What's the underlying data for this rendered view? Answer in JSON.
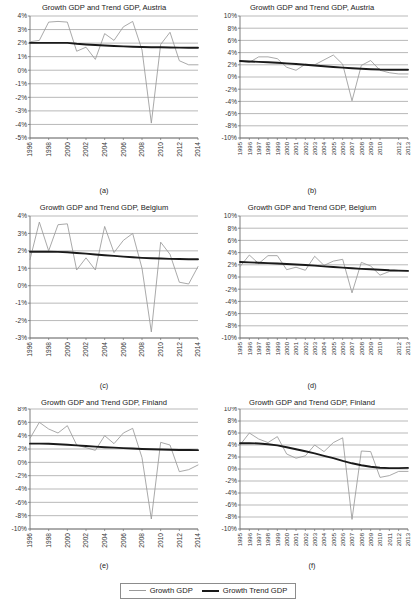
{
  "figure": {
    "legend": {
      "series_thin_label": "Growth GDP",
      "series_thick_label": "Growth Trend GDP",
      "thin_color": "#9a9a9a",
      "thick_color": "#1a1a1a"
    },
    "panel_letters": [
      "(a)",
      "(b)",
      "(c)",
      "(d)",
      "(e)",
      "(f)"
    ]
  },
  "chart_data": [
    {
      "id": "a",
      "type": "line",
      "title": "Growth GDP and Trend GDP, Austria",
      "caption": "(a)",
      "xlabel": "",
      "ylabel": "",
      "grid": true,
      "legend_position": "figure-bottom",
      "ylim": [
        -5,
        4
      ],
      "yticks": [
        4,
        3,
        2,
        1,
        0,
        -1,
        -2,
        -3,
        -4,
        -5
      ],
      "ytick_labels": [
        "4%",
        "3%",
        "2%",
        "1%",
        "0%",
        "-1%",
        "-2%",
        "-3%",
        "-4%",
        "-5%"
      ],
      "x": [
        1996,
        1997,
        1998,
        1999,
        2000,
        2001,
        2002,
        2003,
        2004,
        2005,
        2006,
        2007,
        2008,
        2009,
        2010,
        2011,
        2012,
        2013,
        2014
      ],
      "xtick_labels": [
        "1996",
        "1998",
        "2000",
        "2002",
        "2004",
        "2006",
        "2008",
        "2010",
        "2012",
        "2014"
      ],
      "series": [
        {
          "name": "Growth GDP",
          "values": [
            2.1,
            2.2,
            3.55,
            3.6,
            3.55,
            1.4,
            1.7,
            0.8,
            2.7,
            2.2,
            3.2,
            3.6,
            1.5,
            -3.9,
            1.9,
            2.8,
            0.7,
            0.4,
            0.4
          ]
        },
        {
          "name": "Growth Trend GDP",
          "values": [
            2.02,
            2.02,
            2.02,
            2.02,
            2.02,
            1.95,
            1.9,
            1.86,
            1.82,
            1.79,
            1.76,
            1.73,
            1.71,
            1.7,
            1.69,
            1.68,
            1.67,
            1.66,
            1.66
          ]
        }
      ]
    },
    {
      "id": "b",
      "type": "line",
      "title": "Growth GDP and Trend GDP, Austria",
      "caption": "(b)",
      "xlabel": "",
      "ylabel": "",
      "grid": true,
      "legend_position": "figure-bottom",
      "ylim": [
        -10,
        10
      ],
      "yticks": [
        10,
        8,
        6,
        4,
        2,
        0,
        -2,
        -4,
        -6,
        -8,
        -10
      ],
      "ytick_labels": [
        "10%",
        "8%",
        "6%",
        "4%",
        "2%",
        "0%",
        "-2%",
        "-4%",
        "-6%",
        "-8%",
        "-10%"
      ],
      "x": [
        1995,
        1996,
        1997,
        1998,
        1999,
        2000,
        2001,
        2002,
        2003,
        2004,
        2005,
        2006,
        2007,
        2008,
        2009,
        2010,
        2011,
        2012,
        2013
      ],
      "xtick_labels": [
        "1995",
        "1996",
        "1997",
        "1998",
        "1999",
        "2000",
        "2001",
        "2002",
        "2003",
        "2004",
        "2005",
        "2006",
        "2007",
        "2008",
        "2009",
        "2010",
        "2012",
        "2013"
      ],
      "series": [
        {
          "name": "Growth GDP",
          "values": [
            2.6,
            2.4,
            3.3,
            3.3,
            3.0,
            1.6,
            1.1,
            2.1,
            2.0,
            2.8,
            3.6,
            2.1,
            -3.9,
            1.9,
            2.7,
            1.1,
            0.7,
            0.5,
            0.5
          ]
        },
        {
          "name": "Growth Trend GDP",
          "values": [
            2.62,
            2.55,
            2.48,
            2.41,
            2.33,
            2.23,
            2.12,
            2.0,
            1.88,
            1.76,
            1.65,
            1.54,
            1.44,
            1.35,
            1.28,
            1.22,
            1.2,
            1.2,
            1.2
          ]
        }
      ]
    },
    {
      "id": "c",
      "type": "line",
      "title": "Growth GDP and Trend GDP, Belgium",
      "caption": "(c)",
      "xlabel": "",
      "ylabel": "",
      "grid": true,
      "legend_position": "figure-bottom",
      "ylim": [
        -3,
        4
      ],
      "yticks": [
        4,
        3,
        2,
        1,
        0,
        -1,
        -2,
        -3
      ],
      "ytick_labels": [
        "4%",
        "3%",
        "2%",
        "1%",
        "0%",
        "-1%",
        "-2%",
        "-3%"
      ],
      "x": [
        1996,
        1997,
        1998,
        1999,
        2000,
        2001,
        2002,
        2003,
        2004,
        2005,
        2006,
        2007,
        2008,
        2009,
        2010,
        2011,
        2012,
        2013,
        2014
      ],
      "xtick_labels": [
        "1996",
        "1998",
        "2000",
        "2002",
        "2004",
        "2006",
        "2008",
        "2010",
        "2012",
        "2014"
      ],
      "series": [
        {
          "name": "Growth GDP",
          "values": [
            1.5,
            3.65,
            2.0,
            3.5,
            3.55,
            0.9,
            1.6,
            0.9,
            3.4,
            1.9,
            2.6,
            3.0,
            1.0,
            -2.65,
            2.5,
            1.8,
            0.2,
            0.1,
            1.1
          ]
        },
        {
          "name": "Growth Trend GDP",
          "values": [
            1.95,
            1.95,
            1.95,
            1.94,
            1.92,
            1.88,
            1.84,
            1.79,
            1.75,
            1.71,
            1.67,
            1.63,
            1.6,
            1.58,
            1.56,
            1.54,
            1.53,
            1.52,
            1.52
          ]
        }
      ]
    },
    {
      "id": "d",
      "type": "line",
      "title": "Growth GDP and Trend GDP, Belgium",
      "caption": "(d)",
      "xlabel": "",
      "ylabel": "",
      "grid": true,
      "legend_position": "figure-bottom",
      "ylim": [
        -10,
        10
      ],
      "yticks": [
        10,
        8,
        6,
        4,
        2,
        0,
        -2,
        -4,
        -6,
        -8,
        -10
      ],
      "ytick_labels": [
        "10%",
        "8%",
        "6%",
        "4%",
        "2%",
        "0%",
        "-2%",
        "-4%",
        "-6%",
        "-8%",
        "-10%"
      ],
      "x": [
        1995,
        1996,
        1997,
        1998,
        1999,
        2000,
        2001,
        2002,
        2003,
        2004,
        2005,
        2006,
        2007,
        2008,
        2009,
        2010,
        2011,
        2012,
        2013
      ],
      "xtick_labels": [
        "1995",
        "1996",
        "1997",
        "1998",
        "1999",
        "2000",
        "2001",
        "2002",
        "2003",
        "2004",
        "2005",
        "2006",
        "2007",
        "2008",
        "2009",
        "2010",
        "2012",
        "2013"
      ],
      "series": [
        {
          "name": "Growth GDP",
          "values": [
            1.7,
            3.6,
            2.2,
            3.5,
            3.5,
            1.2,
            1.6,
            1.1,
            3.4,
            1.9,
            2.6,
            2.9,
            -2.6,
            2.4,
            1.8,
            0.3,
            0.9,
            1.0,
            1.0
          ]
        },
        {
          "name": "Growth Trend GDP",
          "values": [
            2.45,
            2.4,
            2.34,
            2.28,
            2.21,
            2.13,
            2.05,
            1.96,
            1.86,
            1.75,
            1.64,
            1.53,
            1.43,
            1.34,
            1.26,
            1.2,
            1.1,
            1.05,
            1.0
          ]
        }
      ]
    },
    {
      "id": "e",
      "type": "line",
      "title": "Growth GDP and Trend GDP, Finland",
      "caption": "(e)",
      "xlabel": "",
      "ylabel": "",
      "grid": true,
      "legend_position": "figure-bottom",
      "ylim": [
        -10,
        8
      ],
      "yticks": [
        8,
        6,
        4,
        2,
        0,
        -2,
        -4,
        -6,
        -8,
        -10
      ],
      "ytick_labels": [
        "8%",
        "6%",
        "4%",
        "2%",
        "0%",
        "-2%",
        "-4%",
        "-6%",
        "-8%",
        "-10%"
      ],
      "x": [
        1996,
        1997,
        1998,
        1999,
        2000,
        2001,
        2002,
        2003,
        2004,
        2005,
        2006,
        2007,
        2008,
        2009,
        2010,
        2011,
        2012,
        2013,
        2014
      ],
      "xtick_labels": [
        "1996",
        "1998",
        "2000",
        "2002",
        "2004",
        "2006",
        "2008",
        "2010",
        "2012",
        "2014"
      ],
      "series": [
        {
          "name": "Growth GDP",
          "values": [
            3.6,
            6.0,
            5.0,
            4.4,
            5.5,
            2.6,
            2.2,
            1.8,
            4.0,
            2.8,
            4.4,
            5.1,
            0.7,
            -8.5,
            3.0,
            2.6,
            -1.4,
            -1.1,
            -0.4
          ]
        },
        {
          "name": "Growth Trend GDP",
          "values": [
            2.8,
            2.8,
            2.78,
            2.72,
            2.64,
            2.55,
            2.45,
            2.36,
            2.27,
            2.2,
            2.13,
            2.07,
            2.01,
            1.96,
            1.92,
            1.89,
            1.86,
            1.84,
            1.83
          ]
        }
      ]
    },
    {
      "id": "f",
      "type": "line",
      "title": "Growth GDP and Trend GDP, Finland",
      "caption": "(f)",
      "xlabel": "",
      "ylabel": "",
      "grid": true,
      "legend_position": "figure-bottom",
      "ylim": [
        -10,
        10
      ],
      "yticks": [
        10,
        8,
        6,
        4,
        2,
        0,
        -2,
        -4,
        -6,
        -8,
        -10
      ],
      "ytick_labels": [
        "10%",
        "8%",
        "6%",
        "4%",
        "2%",
        "0%",
        "-2%",
        "-4%",
        "-6%",
        "-8%",
        "-10%"
      ],
      "x": [
        1995,
        1996,
        1997,
        1998,
        1999,
        2000,
        2001,
        2002,
        2003,
        2004,
        2005,
        2006,
        2007,
        2008,
        2009,
        2010,
        2011,
        2012,
        2013
      ],
      "xtick_labels": [
        "1995",
        "1996",
        "1997",
        "1998",
        "1999",
        "2000",
        "2001",
        "2002",
        "2003",
        "2004",
        "2005",
        "2006",
        "2007",
        "2008",
        "2009",
        "2010",
        "2011",
        "2012",
        "2013"
      ],
      "series": [
        {
          "name": "Growth GDP",
          "values": [
            4.0,
            6.0,
            5.0,
            4.4,
            5.4,
            2.5,
            1.8,
            2.2,
            4.0,
            2.9,
            4.4,
            5.2,
            -8.4,
            3.0,
            2.9,
            -1.4,
            -1.1,
            -0.4,
            -0.4
          ]
        },
        {
          "name": "Growth Trend GDP",
          "values": [
            4.3,
            4.32,
            4.25,
            4.12,
            3.93,
            3.63,
            3.3,
            2.95,
            2.6,
            2.2,
            1.8,
            1.35,
            0.95,
            0.62,
            0.38,
            0.22,
            0.15,
            0.15,
            0.18
          ]
        }
      ]
    }
  ]
}
